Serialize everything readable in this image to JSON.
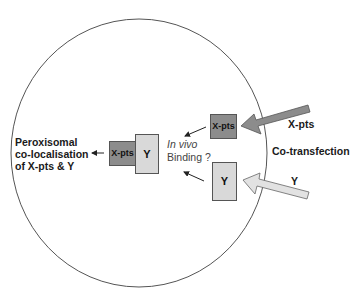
{
  "diagram": {
    "type": "cell-cotransfection-schematic",
    "cell": {
      "shape": "circle",
      "stroke": "#555555",
      "fill": "#ffffff"
    },
    "left_label": {
      "lines": [
        "Peroxisomal",
        "co-localisation",
        "of X-pts & Y"
      ]
    },
    "complex": {
      "x_pts_box": {
        "label": "X-pts",
        "color": "#8c8c8c"
      },
      "y_box": {
        "label": "Y",
        "color": "#d9d9d9"
      }
    },
    "binding_label": {
      "line1": "In vivo",
      "line2": "Binding ?"
    },
    "input_boxes": [
      {
        "label": "X-pts",
        "color": "#8c8c8c"
      },
      {
        "label": "Y",
        "color": "#d9d9d9"
      }
    ],
    "external_arrows": [
      {
        "label": "X-pts",
        "color": "#8c8c8c"
      },
      {
        "label": "Y",
        "color": "#e2e2e2"
      }
    ],
    "cotransfection_label": "Co-transfection"
  }
}
